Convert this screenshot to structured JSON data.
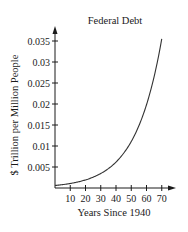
{
  "chart_data": {
    "type": "line",
    "title": "Federal Debt",
    "xlabel": "Years Since 1940",
    "ylabel": "$ Trillion per Million People",
    "xlim": [
      0,
      72
    ],
    "ylim": [
      0,
      0.037
    ],
    "x_ticks": [
      10,
      20,
      30,
      40,
      50,
      60,
      70
    ],
    "x_tick_labels": [
      "10",
      "20",
      "30",
      "40",
      "50",
      "60",
      "70"
    ],
    "y_ticks": [
      0.005,
      0.01,
      0.015,
      0.02,
      0.025,
      0.03,
      0.035
    ],
    "y_tick_labels": [
      "0.005",
      "0.01",
      "0.015",
      "0.02",
      "0.025",
      "0.03",
      "0.035"
    ],
    "grid": false,
    "legend": null,
    "series": [
      {
        "name": "Federal Debt per capita",
        "model": "exponential",
        "x": [
          0,
          10,
          20,
          30,
          40,
          50,
          60,
          70
        ],
        "values": [
          0.0006,
          0.0011,
          0.0019,
          0.0035,
          0.0062,
          0.0112,
          0.02,
          0.0355
        ]
      }
    ]
  },
  "axes": {
    "x_arrow": true,
    "y_arrow": true
  }
}
